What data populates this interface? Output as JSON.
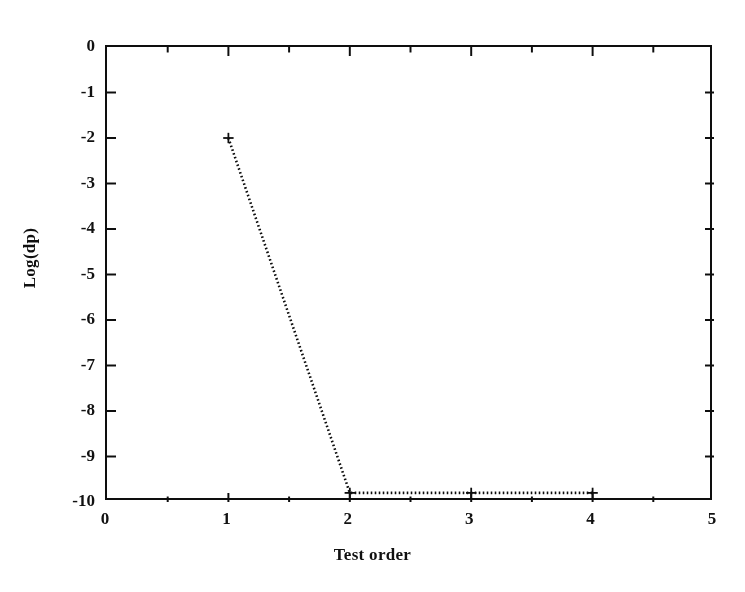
{
  "chart_data": {
    "type": "line",
    "title": "",
    "subtitle": "",
    "xlabel": "Test order",
    "ylabel": "Log(dp)",
    "xlim": [
      0,
      5
    ],
    "ylim": [
      -10,
      0
    ],
    "grid": false,
    "legend": null,
    "x_ticks": [
      0,
      1,
      2,
      3,
      4,
      5
    ],
    "x_tick_labels": [
      "0",
      "1",
      "2",
      "3",
      "4",
      "5"
    ],
    "x_minor_ticks": [
      0.5,
      1.5,
      2.5,
      3.5,
      4.5
    ],
    "y_ticks": [
      0,
      -1,
      -2,
      -3,
      -4,
      -5,
      -6,
      -7,
      -8,
      -9,
      -10
    ],
    "y_tick_labels": [
      "0",
      "-1",
      "-2",
      "-3",
      "-4",
      "-5",
      "-6",
      "-7",
      "-8",
      "-9",
      "-10"
    ],
    "tick_direction": "in",
    "frame": "box",
    "line_style": "dotted",
    "marker": "+",
    "color": "#121212",
    "series": [
      {
        "name": "Log(dp) vs Test order",
        "x": [
          1,
          2,
          3,
          4
        ],
        "values": [
          -2.0,
          -9.8,
          -9.8,
          -9.8
        ]
      }
    ]
  },
  "axes": {
    "x_title": "Test order",
    "y_title": "Log(dp)"
  }
}
